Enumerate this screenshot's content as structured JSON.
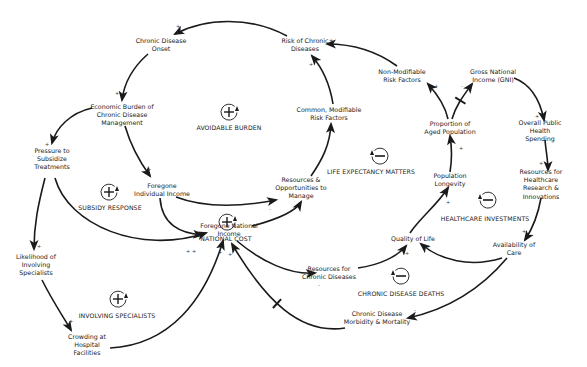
{
  "diagram": {
    "type": "causal-loop-diagram",
    "nodes": [
      {
        "id": "chronic_onset",
        "label": "Chronic Disease\nOnset",
        "x": 161,
        "y": 45
      },
      {
        "id": "risk_chronic",
        "label": "Risk of Chronic\nDiseases",
        "x": 305,
        "y": 45
      },
      {
        "id": "nonmod_risk",
        "label": "Non-Modifiable\nRisk Factors",
        "x": 402,
        "y": 76
      },
      {
        "id": "gni",
        "label": "Gross National\nIncome (GNI)",
        "x": 493,
        "y": 76
      },
      {
        "id": "econ_burden",
        "label": "Economic Burden of\nChronic Disease\nManagement",
        "x": 122,
        "y": 115
      },
      {
        "id": "common_risk",
        "label": "Common, Modifiable\nRisk Factors",
        "x": 329,
        "y": 114
      },
      {
        "id": "aged_pop",
        "label": "Proportion of\nAged Population",
        "x": 450,
        "y": 128
      },
      {
        "id": "public_spending",
        "label": "Overall Public\nHealth Spending",
        "x": 540,
        "y": 131
      },
      {
        "id": "pressure_subsidize",
        "label": "Pressure to\nSubsidize\nTreatments",
        "x": 52,
        "y": 159
      },
      {
        "id": "foregone_individual",
        "label": "Foregone\nIndividual Income",
        "x": 162,
        "y": 190
      },
      {
        "id": "resources_manage",
        "label": "Resources &\nOpportunities to\nManage",
        "x": 301,
        "y": 188
      },
      {
        "id": "pop_longevity",
        "label": "Population\nLongevity",
        "x": 450,
        "y": 180
      },
      {
        "id": "resources_research",
        "label": "Resources for\nHealthcare Research &\nInnovations",
        "x": 541,
        "y": 184
      },
      {
        "id": "foregone_national",
        "label": "Foregone National\nIncome",
        "x": 229,
        "y": 230
      },
      {
        "id": "quality_life",
        "label": "Quality of Life",
        "x": 413,
        "y": 239
      },
      {
        "id": "availability_care",
        "label": "Availability of\nCare",
        "x": 514,
        "y": 249
      },
      {
        "id": "likelihood_specialists",
        "label": "Likelihood of\nInvolving\nSpecialists",
        "x": 36,
        "y": 265
      },
      {
        "id": "resources_chronic",
        "label": "Resources for\nChronic Diseases",
        "x": 329,
        "y": 273
      },
      {
        "id": "morbidity_mortality",
        "label": "Chronic Disease\nMorbidity & Mortality",
        "x": 377,
        "y": 318
      },
      {
        "id": "crowding",
        "label": "Crowding at\nHospital\nFacilities",
        "x": 87,
        "y": 345
      }
    ],
    "loops": [
      {
        "id": "avoidable_burden",
        "label": "AVOIDABLE BURDEN",
        "type": "reinforcing",
        "sign": "+",
        "x": 229,
        "y": 112,
        "lx": 229,
        "ly": 127
      },
      {
        "id": "subsidy_response",
        "label": "SUBSIDY RESPONSE",
        "type": "reinforcing",
        "sign": "+",
        "x": 109,
        "y": 192,
        "lx": 110,
        "ly": 207
      },
      {
        "id": "national_cost",
        "label": "NATIONAL COST",
        "type": "reinforcing",
        "sign": "+",
        "x": 227,
        "y": 222,
        "lx": 226,
        "ly": 238
      },
      {
        "id": "involving_specialists",
        "label": "INVOLVING SPECIALISTS",
        "type": "reinforcing",
        "sign": "+",
        "x": 118,
        "y": 299,
        "lx": 117,
        "ly": 315
      },
      {
        "id": "life_expectancy_matters",
        "label": "LIFE EXPECTANCY MATTERS",
        "type": "balancing",
        "sign": "—",
        "x": 380,
        "y": 156,
        "lx": 371,
        "ly": 171
      },
      {
        "id": "healthcare_investments",
        "label": "HEALTHCARE INVESTMENTS",
        "type": "balancing",
        "sign": "—",
        "x": 488,
        "y": 200,
        "lx": 485,
        "ly": 218
      },
      {
        "id": "chronic_disease_deaths",
        "label": "CHRONIC DISEASE DEATHS",
        "type": "balancing",
        "sign": "—",
        "x": 401,
        "y": 276,
        "lx": 401,
        "ly": 293
      }
    ],
    "links": [
      {
        "from": "risk_chronic",
        "to": "chronic_onset",
        "polarity": "+",
        "path": "M287,36 C250,16 205,18 175,34",
        "delay": false,
        "px": 178,
        "py": 26
      },
      {
        "from": "chronic_onset",
        "to": "econ_burden",
        "polarity": "+",
        "path": "M148,54 C132,68 124,84 122,100",
        "delay": false,
        "px": 117,
        "py": 93
      },
      {
        "from": "econ_burden",
        "to": "pressure_subsidize",
        "polarity": "+",
        "path": "M92,108 C70,113 56,128 52,143",
        "delay": false,
        "px": 47,
        "py": 144
      },
      {
        "from": "econ_burden",
        "to": "foregone_individual",
        "polarity": "+",
        "path": "M125,126 C132,150 142,165 150,176",
        "delay": false,
        "px": 149,
        "py": 169
      },
      {
        "from": "pressure_subsidize",
        "to": "likelihood_specialists",
        "polarity": "+",
        "path": "M45,178 C38,205 34,225 34,249",
        "delay": false,
        "px": 39,
        "py": 246
      },
      {
        "from": "pressure_subsidize",
        "to": "foregone_national",
        "polarity": "+",
        "path": "M55,178 C68,225 140,255 206,233",
        "delay": false,
        "px": 194,
        "py": 251
      },
      {
        "from": "likelihood_specialists",
        "to": "crowding",
        "polarity": "+",
        "path": "M42,280 C52,300 62,315 71,330",
        "delay": false,
        "px": 71,
        "py": 321
      },
      {
        "from": "crowding",
        "to": "foregone_national",
        "polarity": "+",
        "path": "M110,348 C170,345 205,300 223,241",
        "delay": false,
        "px": 220,
        "py": 252
      },
      {
        "from": "foregone_individual",
        "to": "resources_manage",
        "polarity": "-",
        "path": "M176,197 C210,210 250,205 276,200",
        "delay": false,
        "px": 270,
        "py": 209
      },
      {
        "from": "foregone_individual",
        "to": "foregone_national",
        "polarity": "+",
        "path": "M160,198 C162,225 180,233 202,235",
        "delay": false,
        "px": 188,
        "py": 251
      },
      {
        "from": "foregone_national",
        "to": "resources_manage",
        "polarity": "-",
        "path": "M252,226 C275,220 295,212 301,202",
        "delay": false,
        "px": 294,
        "py": 209
      },
      {
        "from": "resources_manage",
        "to": "common_risk",
        "polarity": "-",
        "path": "M311,176 C322,160 330,145 331,124",
        "delay": false,
        "px": 327,
        "py": 131
      },
      {
        "from": "common_risk",
        "to": "risk_chronic",
        "polarity": "+",
        "path": "M333,104 C330,85 324,70 312,56",
        "delay": false,
        "px": 311,
        "py": 64
      },
      {
        "from": "nonmod_risk",
        "to": "risk_chronic",
        "polarity": "+",
        "path": "M397,66 C375,50 350,44 327,44",
        "delay": false,
        "px": 331,
        "py": 40
      },
      {
        "from": "aged_pop",
        "to": "nonmod_risk",
        "polarity": "+",
        "path": "M448,119 C445,105 438,95 428,84",
        "delay": false,
        "px": 436,
        "py": 86
      },
      {
        "from": "aged_pop",
        "to": "gni",
        "polarity": "-",
        "path": "M452,119 C456,105 464,95 472,84",
        "delay": true,
        "px": 462,
        "py": 86
      },
      {
        "from": "gni",
        "to": "public_spending",
        "polarity": "+",
        "path": "M514,78 C530,84 540,100 544,120",
        "delay": false,
        "px": 537,
        "py": 116
      },
      {
        "from": "public_spending",
        "to": "resources_research",
        "polarity": "+",
        "path": "M545,140 C546,152 548,160 548,170",
        "delay": false,
        "px": 541,
        "py": 163
      },
      {
        "from": "resources_research",
        "to": "availability_care",
        "polarity": "+",
        "path": "M541,198 C538,215 533,228 525,240",
        "delay": false,
        "px": 524,
        "py": 231
      },
      {
        "from": "availability_care",
        "to": "quality_life",
        "polarity": "+",
        "path": "M502,258 C470,268 440,260 421,244",
        "delay": false,
        "px": 428,
        "py": 246
      },
      {
        "from": "availability_care",
        "to": "morbidity_mortality",
        "polarity": "-",
        "path": "M507,258 C480,290 445,310 408,318",
        "delay": false,
        "px": 415,
        "py": 310
      },
      {
        "from": "quality_life",
        "to": "pop_longevity",
        "polarity": "+",
        "path": "M410,233 C420,218 437,205 448,188",
        "delay": false,
        "px": 448,
        "py": 202
      },
      {
        "from": "pop_longevity",
        "to": "aged_pop",
        "polarity": "+",
        "path": "M450,172 C452,160 452,148 450,136",
        "delay": false,
        "px": 461,
        "py": 148
      },
      {
        "from": "resources_chronic",
        "to": "quality_life",
        "polarity": "+",
        "path": "M358,268 C380,265 398,256 406,246",
        "delay": false,
        "px": 407,
        "py": 253
      },
      {
        "from": "foregone_national",
        "to": "resources_chronic",
        "polarity": "-",
        "path": "M237,241 C262,262 290,275 315,273",
        "delay": false,
        "px": 319,
        "py": 285
      },
      {
        "from": "morbidity_mortality",
        "to": "foregone_national",
        "polarity": "+",
        "path": "M345,328 C300,335 265,300 232,244",
        "delay": true,
        "px": 230,
        "py": 254
      }
    ]
  },
  "colors": {
    "line": "#1a1a1a",
    "text": "#1a1a1a",
    "background": "#ffffff"
  }
}
